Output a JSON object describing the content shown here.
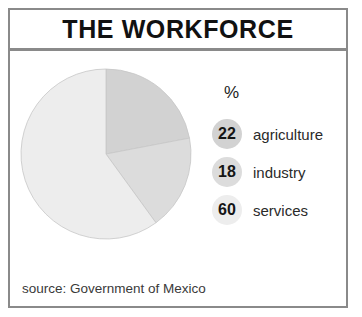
{
  "card": {
    "title": "THE WORKFORCE",
    "source": "source: Government of Mexico"
  },
  "legend": {
    "unit_header": "%",
    "entries": [
      {
        "value": "22",
        "label": "agriculture",
        "color": "#d2d2d2"
      },
      {
        "value": "18",
        "label": "industry",
        "color": "#dcdcdc"
      },
      {
        "value": "60",
        "label": "services",
        "color": "#ededed"
      }
    ]
  },
  "colors": {
    "frame": "#8a8a8a",
    "title_text": "#111111",
    "agriculture": "#d2d2d2",
    "industry": "#dcdcdc",
    "services": "#ededed",
    "wedge_stroke": "#c6c6c6"
  },
  "chart_data": {
    "type": "pie",
    "title": "THE WORKFORCE",
    "subtitle": "",
    "unit": "%",
    "categories": [
      "agriculture",
      "industry",
      "services"
    ],
    "values": [
      22,
      18,
      60
    ],
    "colors": [
      "#d2d2d2",
      "#dcdcdc",
      "#ededed"
    ],
    "start_angle_deg": 0,
    "direction": "clockwise",
    "legend_position": "right",
    "grid": false,
    "total": 100,
    "slices": [
      {
        "label": "agriculture",
        "value": 22,
        "start_deg": 0,
        "end_deg": 79.2,
        "color": "#d2d2d2"
      },
      {
        "label": "industry",
        "value": 18,
        "start_deg": 79.2,
        "end_deg": 144.0,
        "color": "#dcdcdc"
      },
      {
        "label": "services",
        "value": 60,
        "start_deg": 144.0,
        "end_deg": 360.0,
        "color": "#ededed"
      }
    ],
    "source": "source: Government of Mexico"
  }
}
